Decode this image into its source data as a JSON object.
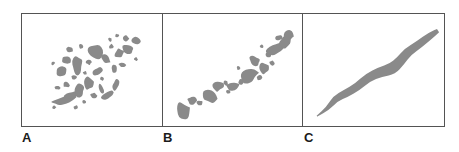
{
  "figure": {
    "width": 459,
    "height": 152,
    "background_color": "#ffffff",
    "border_color": "#545454",
    "blob_color": "#8a8a8a"
  },
  "panels": [
    {
      "id": "a",
      "label": "A",
      "description": "highly fragmented scattered patches along a diagonal",
      "blob_count": 36
    },
    {
      "id": "b",
      "label": "B",
      "description": "moderately fragmented patches forming a broken diagonal chain",
      "blob_count": 21
    },
    {
      "id": "c",
      "label": "C",
      "description": "single continuous sinuous diagonal band",
      "blob_count": 1
    }
  ],
  "chart_data": {
    "type": "scatter",
    "title": "",
    "xlabel": "",
    "ylabel": "",
    "xlim": [
      0,
      140
    ],
    "ylim": [
      0,
      114
    ],
    "grid": false,
    "legend": "none",
    "series": [
      {
        "name": "A",
        "panel": "a",
        "shape": "fragmented-patches",
        "fill": "#8a8a8a",
        "blobs": [
          {
            "cx": 32,
            "cy": 95,
            "rx": 2.0,
            "ry": 2.0,
            "rot": 0
          },
          {
            "cx": 41,
            "cy": 88,
            "rx": 13.0,
            "ry": 4.5,
            "rot": -14
          },
          {
            "cx": 50,
            "cy": 83,
            "rx": 8.0,
            "ry": 4.0,
            "rot": -18
          },
          {
            "cx": 35,
            "cy": 75,
            "rx": 3.0,
            "ry": 2.6,
            "rot": 0
          },
          {
            "cx": 44,
            "cy": 72,
            "rx": 3.4,
            "ry": 2.8,
            "rot": 12
          },
          {
            "cx": 57,
            "cy": 77,
            "rx": 6.5,
            "ry": 7.5,
            "rot": 20
          },
          {
            "cx": 52,
            "cy": 64,
            "rx": 3.0,
            "ry": 2.4,
            "rot": 0
          },
          {
            "cx": 40,
            "cy": 58,
            "rx": 6.5,
            "ry": 5.0,
            "rot": -25
          },
          {
            "cx": 31,
            "cy": 50,
            "rx": 2.2,
            "ry": 2.0,
            "rot": 0
          },
          {
            "cx": 44,
            "cy": 47,
            "rx": 5.0,
            "ry": 4.0,
            "rot": 30
          },
          {
            "cx": 55,
            "cy": 53,
            "rx": 5.5,
            "ry": 10.0,
            "rot": 8
          },
          {
            "cx": 66,
            "cy": 70,
            "rx": 5.0,
            "ry": 7.5,
            "rot": -10
          },
          {
            "cx": 72,
            "cy": 83,
            "rx": 4.0,
            "ry": 3.2,
            "rot": 0
          },
          {
            "cx": 79,
            "cy": 76,
            "rx": 3.0,
            "ry": 5.5,
            "rot": -20
          },
          {
            "cx": 86,
            "cy": 83,
            "rx": 7.0,
            "ry": 4.0,
            "rot": -28
          },
          {
            "cx": 94,
            "cy": 72,
            "rx": 3.2,
            "ry": 6.0,
            "rot": 15
          },
          {
            "cx": 76,
            "cy": 58,
            "rx": 6.0,
            "ry": 4.0,
            "rot": -35
          },
          {
            "cx": 67,
            "cy": 49,
            "rx": 3.0,
            "ry": 3.0,
            "rot": 0
          },
          {
            "cx": 48,
            "cy": 36,
            "rx": 3.4,
            "ry": 3.0,
            "rot": 0
          },
          {
            "cx": 59,
            "cy": 33,
            "rx": 2.4,
            "ry": 2.4,
            "rot": 0
          },
          {
            "cx": 72,
            "cy": 38,
            "rx": 10.0,
            "ry": 8.0,
            "rot": 25
          },
          {
            "cx": 84,
            "cy": 46,
            "rx": 6.0,
            "ry": 4.0,
            "rot": 35
          },
          {
            "cx": 92,
            "cy": 56,
            "rx": 3.0,
            "ry": 4.0,
            "rot": 0
          },
          {
            "cx": 100,
            "cy": 52,
            "rx": 3.6,
            "ry": 3.0,
            "rot": 0
          },
          {
            "cx": 89,
            "cy": 33,
            "rx": 2.6,
            "ry": 2.6,
            "rot": 0
          },
          {
            "cx": 97,
            "cy": 40,
            "rx": 5.0,
            "ry": 4.5,
            "rot": -20
          },
          {
            "cx": 106,
            "cy": 36,
            "rx": 6.5,
            "ry": 5.0,
            "rot": 18
          },
          {
            "cx": 104,
            "cy": 25,
            "rx": 3.0,
            "ry": 3.4,
            "rot": 0
          },
          {
            "cx": 95,
            "cy": 22,
            "rx": 2.0,
            "ry": 2.0,
            "rot": 0
          },
          {
            "cx": 114,
            "cy": 27,
            "rx": 5.0,
            "ry": 4.0,
            "rot": -25
          },
          {
            "cx": 88,
            "cy": 26,
            "rx": 2.2,
            "ry": 2.0,
            "rot": 0
          },
          {
            "cx": 63,
            "cy": 60,
            "rx": 2.2,
            "ry": 2.0,
            "rot": 0
          },
          {
            "cx": 80,
            "cy": 66,
            "rx": 2.0,
            "ry": 2.0,
            "rot": 0
          },
          {
            "cx": 62,
            "cy": 89,
            "rx": 2.2,
            "ry": 2.0,
            "rot": 0
          },
          {
            "cx": 54,
            "cy": 95,
            "rx": 2.4,
            "ry": 2.2,
            "rot": 0
          },
          {
            "cx": 114,
            "cy": 46,
            "rx": 2.0,
            "ry": 2.0,
            "rot": 0
          }
        ]
      },
      {
        "name": "B",
        "panel": "b",
        "shape": "broken-chain",
        "fill": "#8a8a8a",
        "blobs": [
          {
            "cx": 20,
            "cy": 99,
            "rx": 7.0,
            "ry": 10.0,
            "rot": -28
          },
          {
            "cx": 29,
            "cy": 88,
            "rx": 5.0,
            "ry": 5.0,
            "rot": 0
          },
          {
            "cx": 37,
            "cy": 91,
            "rx": 3.2,
            "ry": 3.0,
            "rot": 0
          },
          {
            "cx": 46,
            "cy": 83,
            "rx": 8.0,
            "ry": 8.5,
            "rot": 20
          },
          {
            "cx": 55,
            "cy": 74,
            "rx": 6.0,
            "ry": 5.0,
            "rot": -30
          },
          {
            "cx": 63,
            "cy": 70,
            "rx": 3.0,
            "ry": 2.8,
            "rot": 0
          },
          {
            "cx": 70,
            "cy": 73,
            "rx": 7.0,
            "ry": 4.5,
            "rot": -12
          },
          {
            "cx": 79,
            "cy": 69,
            "rx": 3.2,
            "ry": 3.0,
            "rot": 0
          },
          {
            "cx": 86,
            "cy": 62,
            "rx": 11.0,
            "ry": 8.0,
            "rot": -12
          },
          {
            "cx": 97,
            "cy": 65,
            "rx": 3.0,
            "ry": 2.6,
            "rot": 0
          },
          {
            "cx": 92,
            "cy": 48,
            "rx": 6.0,
            "ry": 5.0,
            "rot": 20
          },
          {
            "cx": 101,
            "cy": 55,
            "rx": 5.0,
            "ry": 6.5,
            "rot": -25
          },
          {
            "cx": 110,
            "cy": 50,
            "rx": 3.0,
            "ry": 3.0,
            "rot": 0
          },
          {
            "cx": 106,
            "cy": 41,
            "rx": 4.0,
            "ry": 3.2,
            "rot": 0
          },
          {
            "cx": 114,
            "cy": 36,
            "rx": 10.0,
            "ry": 6.0,
            "rot": -22
          },
          {
            "cx": 123,
            "cy": 29,
            "rx": 6.0,
            "ry": 6.0,
            "rot": 15
          },
          {
            "cx": 117,
            "cy": 24,
            "rx": 4.0,
            "ry": 3.0,
            "rot": -20
          },
          {
            "cx": 127,
            "cy": 22,
            "rx": 5.0,
            "ry": 7.0,
            "rot": 10
          },
          {
            "cx": 66,
            "cy": 79,
            "rx": 2.2,
            "ry": 2.0,
            "rot": 0
          },
          {
            "cx": 76,
            "cy": 55,
            "rx": 2.0,
            "ry": 2.0,
            "rot": 0
          },
          {
            "cx": 99,
            "cy": 33,
            "rx": 2.2,
            "ry": 2.0,
            "rot": 0
          }
        ]
      },
      {
        "name": "C",
        "panel": "c",
        "shape": "continuous-band",
        "fill": "#8a8a8a",
        "path_points": [
          {
            "x": 14,
            "y": 104,
            "w": 1
          },
          {
            "x": 25,
            "y": 96,
            "w": 4
          },
          {
            "x": 33,
            "y": 86,
            "w": 7
          },
          {
            "x": 43,
            "y": 81,
            "w": 8
          },
          {
            "x": 55,
            "y": 74,
            "w": 8
          },
          {
            "x": 65,
            "y": 65,
            "w": 9
          },
          {
            "x": 78,
            "y": 59,
            "w": 10
          },
          {
            "x": 90,
            "y": 56,
            "w": 12
          },
          {
            "x": 98,
            "y": 48,
            "w": 10
          },
          {
            "x": 106,
            "y": 38,
            "w": 9
          },
          {
            "x": 117,
            "y": 31,
            "w": 8
          },
          {
            "x": 128,
            "y": 22,
            "w": 7
          },
          {
            "x": 136,
            "y": 17,
            "w": 4
          }
        ]
      }
    ]
  }
}
